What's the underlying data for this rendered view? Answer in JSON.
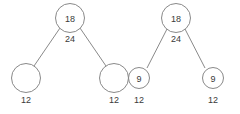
{
  "figure": {
    "type": "tree-diagram",
    "background_color": "#ffffff",
    "stroke_color": "#7c7c7c",
    "text_color": "#3a3a3a"
  },
  "trees": [
    {
      "name": "left-tree",
      "root": {
        "label": "18",
        "cx": 70,
        "cy": 18,
        "r": 14.5
      },
      "edge_label": {
        "text": "24",
        "x": 70,
        "y": 39
      },
      "edges": [
        {
          "x1": 60,
          "y1": 28,
          "x2": 34,
          "y2": 66
        },
        {
          "x1": 80,
          "y1": 28,
          "x2": 106,
          "y2": 66
        }
      ],
      "leaves": [
        {
          "label": "",
          "cx": 26,
          "cy": 78,
          "r": 14.5,
          "below_label": "12",
          "below_x": 26,
          "below_y": 100
        },
        {
          "label": "",
          "cx": 114,
          "cy": 78,
          "r": 14.5,
          "below_label": "12",
          "below_x": 114,
          "below_y": 100
        }
      ]
    },
    {
      "name": "right-tree",
      "root": {
        "label": "18",
        "cx": 176,
        "cy": 18,
        "r": 14.5
      },
      "edge_label": {
        "text": "24",
        "x": 176,
        "y": 39
      },
      "edges": [
        {
          "x1": 167,
          "y1": 29,
          "x2": 147,
          "y2": 68
        },
        {
          "x1": 185,
          "y1": 29,
          "x2": 205,
          "y2": 68
        }
      ],
      "leaves": [
        {
          "label": "9",
          "cx": 139,
          "cy": 78,
          "r": 10.5,
          "below_label": "12",
          "below_x": 139,
          "below_y": 100
        },
        {
          "label": "9",
          "cx": 213,
          "cy": 78,
          "r": 10.5,
          "below_label": "12",
          "below_x": 213,
          "below_y": 100
        }
      ]
    }
  ]
}
